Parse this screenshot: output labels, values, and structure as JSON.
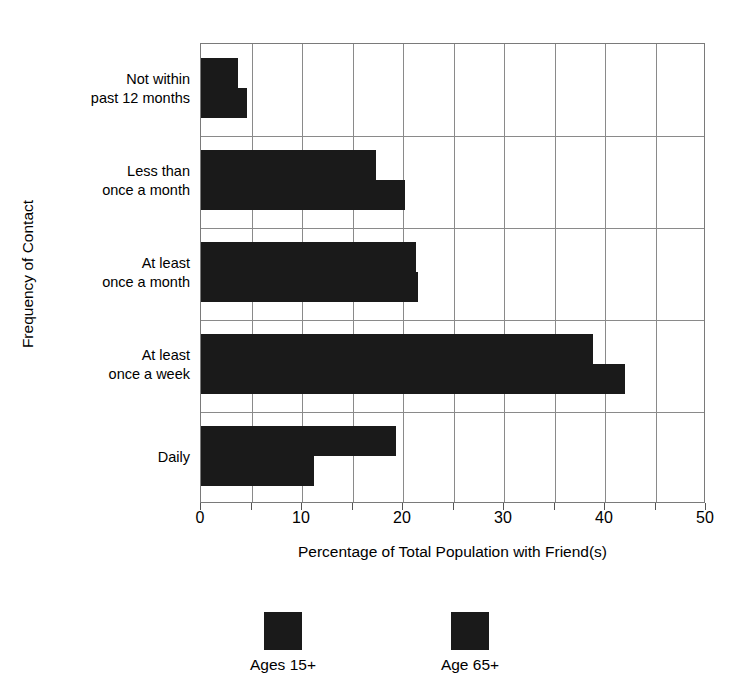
{
  "chart_data": {
    "type": "bar",
    "orientation": "horizontal",
    "title": "",
    "xlabel": "Percentage of Total Population with Friend(s)",
    "ylabel": "Frequency of Contact",
    "categories": [
      "Not within past 12 months",
      "Less than once a month",
      "At least once a month",
      "At least once a week",
      "Daily"
    ],
    "category_lines": [
      [
        "Not within",
        "past 12 months"
      ],
      [
        "Less than",
        "once a month"
      ],
      [
        "At least",
        "once a month"
      ],
      [
        "At least",
        "once a week"
      ],
      [
        "Daily"
      ]
    ],
    "series": [
      {
        "name": "Ages 15+",
        "color": "#1a1a1a",
        "values": [
          3.7,
          17.3,
          21.3,
          38.8,
          19.3
        ]
      },
      {
        "name": "Age 65+",
        "color": "#1a1a1a",
        "values": [
          4.6,
          20.2,
          21.5,
          42.0,
          11.2
        ]
      }
    ],
    "xlim": [
      0,
      50
    ],
    "xticks": [
      0,
      5,
      10,
      15,
      20,
      25,
      30,
      35,
      40,
      45,
      50
    ],
    "xtick_labels": [
      "0",
      "",
      "10",
      "",
      "20",
      "",
      "30",
      "",
      "40",
      "",
      "50"
    ],
    "grid": "vertical-and-horizontal",
    "legend_position": "bottom"
  },
  "axis": {
    "x_title": "Percentage of Total Population with Friend(s)",
    "y_title": "Frequency of Contact"
  },
  "legend": {
    "items": [
      {
        "label": "Ages 15+"
      },
      {
        "label": "Age 65+"
      }
    ]
  }
}
